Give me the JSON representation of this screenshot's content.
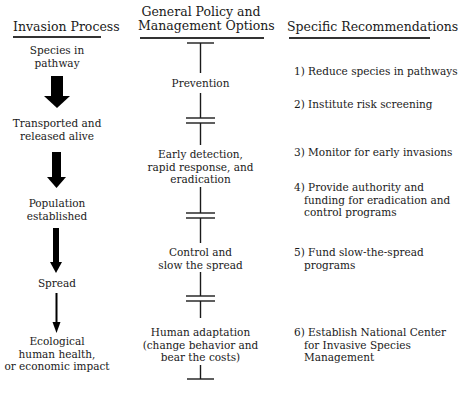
{
  "headers": {
    "left": "Invasion Process",
    "center_line1": "General Policy and",
    "center_line2": "Management Options",
    "right": "Specific Recommendations"
  },
  "invasion_process": [
    {
      "line1": "Species in",
      "line2": "pathway"
    },
    {
      "line1": "Transported and",
      "line2": "released alive"
    },
    {
      "line1": "Population",
      "line2": "established"
    },
    {
      "line1": "Spread",
      "line2": ""
    },
    {
      "line1": "Ecological",
      "line2": "human health,",
      "line3": "or economic impact"
    }
  ],
  "arrows": [
    {
      "from": "Species in pathway",
      "to": "Transported and released alive",
      "weight": "heaviest",
      "icon": "down-arrow-icon"
    },
    {
      "from": "Transported and released alive",
      "to": "Population established",
      "weight": "heavy",
      "icon": "down-arrow-icon"
    },
    {
      "from": "Population established",
      "to": "Spread",
      "weight": "medium",
      "icon": "down-arrow-icon"
    },
    {
      "from": "Spread",
      "to": "Ecological, human health, or economic impact",
      "weight": "thin",
      "icon": "down-arrow-icon"
    }
  ],
  "management_options": [
    {
      "line1": "Prevention"
    },
    {
      "line1": "Early detection,",
      "line2": "rapid response, and",
      "line3": "eradication"
    },
    {
      "line1": "Control and",
      "line2": "slow the spread"
    },
    {
      "line1": "Human adaptation",
      "line2": "(change behavior and",
      "line3": "bear the costs)"
    }
  ],
  "recommendations": [
    {
      "line1": "1) Reduce species in pathways"
    },
    {
      "line1": "2) Institute risk screening"
    },
    {
      "line1": "3) Monitor for early invasions"
    },
    {
      "line1": "4) Provide authority and",
      "line2": "funding for eradication and",
      "line3": "control programs"
    },
    {
      "line1": "5) Fund slow-the-spread",
      "line2": "programs"
    },
    {
      "line1": "6) Establish National Center",
      "line2": "for Invasive Species",
      "line3": "Management"
    }
  ],
  "colors": {
    "line": "#1a1a1a",
    "background": "#ffffff"
  }
}
